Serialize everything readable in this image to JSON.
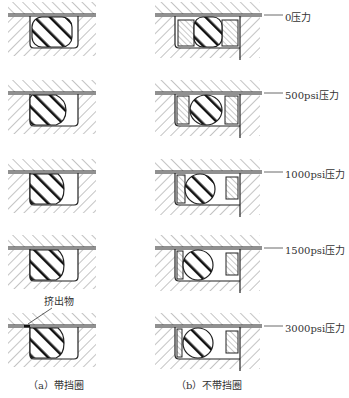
{
  "figure": {
    "type": "seal-extrusion-diagram",
    "columns": [
      {
        "id": "a",
        "caption": "（a）带挡圈"
      },
      {
        "id": "b",
        "caption": "（b）不带挡圈"
      }
    ],
    "rows": [
      {
        "pressure_label": "0压力"
      },
      {
        "pressure_label": "500psi压力"
      },
      {
        "pressure_label": "1000psi压力"
      },
      {
        "pressure_label": "1500psi压力"
      },
      {
        "pressure_label": "3000psi压力"
      }
    ],
    "annotation": "挤出物",
    "colors": {
      "line": "#222222",
      "hatch": "#8a8a8a",
      "oring_stripe": "#111111",
      "background": "#ffffff"
    }
  }
}
